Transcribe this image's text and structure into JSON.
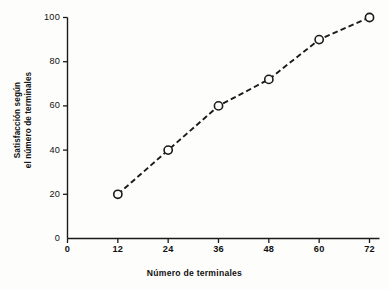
{
  "chart_data": {
    "type": "line",
    "title": "",
    "subtitle": "",
    "xlabel": "Número de terminales",
    "ylabel": "Satisfacción según el número de terminales",
    "ylabel_lines": [
      "Satisfacción según",
      "el número de terminales"
    ],
    "x": [
      12,
      24,
      36,
      48,
      60,
      72
    ],
    "values": [
      20,
      40,
      60,
      72,
      90,
      100
    ],
    "series": [
      {
        "name": "Satisfacción",
        "values": [
          20,
          40,
          60,
          72,
          90,
          100
        ],
        "line_style": "dashed",
        "marker": "open-circle",
        "color": "#1a1a1a"
      }
    ],
    "xticks": [
      0,
      12,
      24,
      36,
      48,
      60,
      72
    ],
    "xtick_labels": [
      "0",
      "12",
      "24",
      "36",
      "48",
      "60",
      "72"
    ],
    "yticks": [
      0,
      20,
      40,
      60,
      80,
      100
    ],
    "ytick_labels": [
      "0",
      "20",
      "40",
      "60",
      "80",
      "100"
    ],
    "xlim": [
      0,
      72
    ],
    "ylim": [
      0,
      100
    ],
    "grid": false,
    "legend": false,
    "legend_position": "none",
    "background_color": "#fdfdfb",
    "axis_color": "#1a1a1a"
  }
}
